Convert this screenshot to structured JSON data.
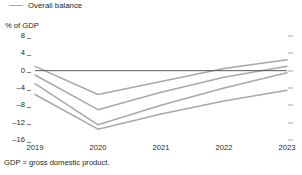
{
  "legend": {
    "marker": "line-swatch-icon",
    "label": "Overall balance"
  },
  "axis": {
    "y_title": "% of GDP",
    "y_ticks": [
      "8",
      "4",
      "0",
      "-4",
      "-8",
      "-12",
      "-16"
    ],
    "x_ticks": [
      "2019",
      "2020",
      "2021",
      "2022",
      "2023"
    ]
  },
  "footnote": "GDP = gross domestic product.",
  "colors": {
    "line": "#a6a8ab",
    "zero_line": "#58595b",
    "tick": "#808285",
    "text": "#231f20",
    "background": "#ffffff"
  },
  "chart_data": {
    "type": "line",
    "title": "",
    "subtitle": "",
    "xlabel": "",
    "ylabel": "% of GDP",
    "x": [
      "2019",
      "2020",
      "2021",
      "2022",
      "2023"
    ],
    "ylim": [
      -16,
      8
    ],
    "ytick_values": [
      8,
      4,
      0,
      -4,
      -8,
      -12,
      -16
    ],
    "grid": false,
    "legend_position": "top-left",
    "legend_entries": [
      "Overall balance"
    ],
    "zero_line": 0,
    "series": [
      {
        "name": "Overall balance 1",
        "values": [
          1.0,
          -5.5,
          -2.5,
          0.5,
          2.5
        ]
      },
      {
        "name": "Overall balance 2",
        "values": [
          -1.0,
          -9.0,
          -5.0,
          -1.5,
          1.0
        ]
      },
      {
        "name": "Overall balance 3",
        "values": [
          -3.0,
          -12.5,
          -8.0,
          -4.0,
          -0.5
        ]
      },
      {
        "name": "Overall balance 4",
        "values": [
          -5.5,
          -13.5,
          -10.0,
          -7.0,
          -4.5
        ]
      }
    ],
    "annotations": [
      "GDP = gross domestic product."
    ]
  }
}
